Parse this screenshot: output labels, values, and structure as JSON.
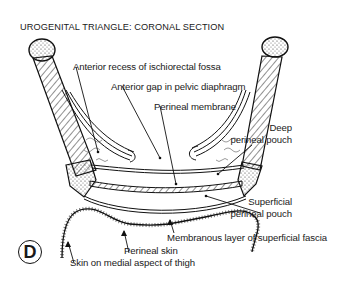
{
  "figure": {
    "title": "UROGENITAL TRIANGLE: CORONAL SECTION",
    "panel_letter": "D"
  },
  "labels": {
    "anterior_recess": "Anterior recess of ischiorectal fossa",
    "anterior_gap": "Anterior gap in pelvic diaphragm",
    "perineal_membrane": "Perineal membrane",
    "deep_pouch_line1": "Deep",
    "deep_pouch_line2": "perineal pouch",
    "superficial_pouch_line1": "Superficial",
    "superficial_pouch_line2": "perineal pouch",
    "membranous_layer": "Membranous layer of superficial fascia",
    "perineal_skin": "Perineal skin",
    "skin_thigh": "Skin on medial aspect of thigh"
  },
  "colors": {
    "ink": "#1a1a1a",
    "background": "#ffffff"
  }
}
